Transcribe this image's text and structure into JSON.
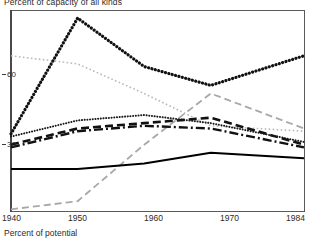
{
  "chart_data": {
    "type": "line",
    "title": "Percent of capacity of all kinds",
    "footnote": "Percent of potential",
    "xlabel": "",
    "ylabel": "",
    "xlim": [
      1940,
      1984
    ],
    "ylim": [
      0,
      75
    ],
    "grid": false,
    "legend": "none",
    "xticks": [
      1940,
      1950,
      1960,
      1970,
      1984
    ],
    "xticklabels": [
      "1940",
      "1950",
      "1960",
      "1970",
      "1984"
    ],
    "yticks": [
      30,
      60
    ],
    "yticklabels": [
      "30",
      "60"
    ],
    "series": [
      {
        "name": "heavy-dotted-peak",
        "style": "dotted-heavy",
        "color": "#111111",
        "x": [
          1940,
          1950,
          1960,
          1970,
          1984
        ],
        "values": [
          29,
          72,
          54,
          47,
          58
        ]
      },
      {
        "name": "light-dotted-declining",
        "style": "dotted-light",
        "color": "#b9b9b9",
        "x": [
          1940,
          1950,
          1960,
          1970,
          1984
        ],
        "values": [
          58,
          55,
          44,
          32,
          30
        ]
      },
      {
        "name": "fine-dotted-mid",
        "style": "dotted-fine",
        "color": "#1a1a1a",
        "x": [
          1940,
          1950,
          1960,
          1970,
          1984
        ],
        "values": [
          28,
          34,
          36,
          33,
          26
        ]
      },
      {
        "name": "dashed-mid",
        "style": "dashed",
        "color": "#111111",
        "x": [
          1940,
          1950,
          1960,
          1970,
          1984
        ],
        "values": [
          25,
          31,
          33,
          35,
          25
        ]
      },
      {
        "name": "dash-dot-mid",
        "style": "dash-dot",
        "color": "#111111",
        "x": [
          1940,
          1950,
          1960,
          1970,
          1984
        ],
        "values": [
          24,
          30,
          32,
          31,
          24
        ]
      },
      {
        "name": "solid-lower",
        "style": "solid",
        "color": "#000000",
        "x": [
          1940,
          1950,
          1960,
          1970,
          1984
        ],
        "values": [
          16,
          16,
          18,
          22,
          20
        ]
      },
      {
        "name": "gray-dashed-rising",
        "style": "dashed-gray",
        "color": "#a8a8a8",
        "x": [
          1940,
          1950,
          1960,
          1970,
          1984
        ],
        "values": [
          1,
          4,
          25,
          44,
          31
        ]
      }
    ]
  },
  "axis": {
    "y_tick_60": "60",
    "y_tick_30": "30"
  }
}
